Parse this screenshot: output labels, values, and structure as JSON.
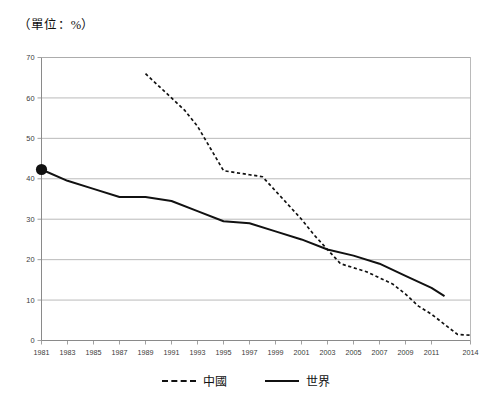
{
  "unit_note": "（單位：%）",
  "legend": {
    "position": "bottom-center",
    "items": [
      {
        "label": "中國",
        "style": "dashed",
        "color": "#111111"
      },
      {
        "label": "世界",
        "style": "solid",
        "color": "#111111"
      }
    ]
  },
  "chart_data": {
    "type": "line",
    "title": "",
    "subtitle": "",
    "xlabel": "",
    "ylabel": "",
    "unit": "%",
    "grid": "horizontal",
    "legend_position": "bottom-center",
    "xlim": [
      1981,
      2014
    ],
    "ylim": [
      0,
      70
    ],
    "ytick_step": 10,
    "ytick_labels": [
      "0",
      "10",
      "20",
      "30",
      "40",
      "50",
      "60",
      "70"
    ],
    "ytick_values": [
      0,
      10,
      20,
      30,
      40,
      50,
      60,
      70
    ],
    "xtick_labels": [
      "1981",
      "1983",
      "1985",
      "1987",
      "1989",
      "1991",
      "1993",
      "1995",
      "1997",
      "1999",
      "2001",
      "2003",
      "2005",
      "2007",
      "2009",
      "2011",
      "2014"
    ],
    "xtick_values": [
      1981,
      1983,
      1985,
      1987,
      1989,
      1991,
      1993,
      1995,
      1997,
      1999,
      2001,
      2003,
      2005,
      2007,
      2009,
      2011,
      2014
    ],
    "annotations": [
      {
        "name": "start-marker",
        "series": "世界",
        "x": 1981,
        "y": 42.3,
        "shape": "filled-circle"
      }
    ],
    "series": [
      {
        "name": "中國",
        "style": "dashed",
        "color": "#111111",
        "x": [
          1989,
          1990,
          1991,
          1992,
          1993,
          1994,
          1995,
          1996,
          1997,
          1998,
          1999,
          2000,
          2001,
          2002,
          2003,
          2004,
          2005,
          2006,
          2007,
          2008,
          2009,
          2010,
          2011,
          2012,
          2013,
          2014
        ],
        "values": [
          66.0,
          63.0,
          60.0,
          57.0,
          53.0,
          47.5,
          42.0,
          41.5,
          41.0,
          40.5,
          37.0,
          33.5,
          30.0,
          26.0,
          22.5,
          19.0,
          18.0,
          17.0,
          15.5,
          14.0,
          11.5,
          8.5,
          6.5,
          4.0,
          1.5,
          1.3
        ]
      },
      {
        "name": "世界",
        "style": "solid",
        "color": "#111111",
        "x": [
          1981,
          1983,
          1985,
          1987,
          1989,
          1991,
          1993,
          1995,
          1997,
          1999,
          2001,
          2003,
          2005,
          2007,
          2009,
          2010,
          2011,
          2012
        ],
        "values": [
          42.3,
          39.5,
          37.5,
          35.5,
          35.5,
          34.5,
          32.0,
          29.5,
          29.0,
          27.0,
          25.0,
          22.5,
          21.0,
          19.0,
          16.0,
          14.5,
          13.0,
          11.0
        ]
      }
    ]
  }
}
